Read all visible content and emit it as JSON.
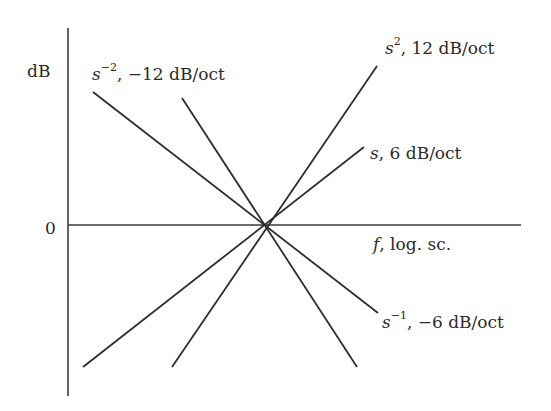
{
  "diagram": {
    "type": "bode-asymptote-slopes",
    "axes": {
      "y_label": "dB",
      "zero_label": "0",
      "x_label_var": "f",
      "x_label_rest": ", log. sc."
    },
    "origin": {
      "x": 265,
      "y": 225
    },
    "lines": [
      {
        "id": "s2",
        "base": "s",
        "exp": "2",
        "slope_text": ", 12 dB/oct",
        "x1": 172,
        "y1": 367,
        "x2": 377,
        "y2": 66
      },
      {
        "id": "s1",
        "base": "s",
        "exp": "",
        "slope_text": ", 6 dB/oct",
        "x1": 83,
        "y1": 367,
        "x2": 364,
        "y2": 147
      },
      {
        "id": "sm1",
        "base": "s",
        "exp": "−1",
        "slope_text": ", −6 dB/oct",
        "x1": 93,
        "y1": 92,
        "x2": 378,
        "y2": 313
      },
      {
        "id": "sm2",
        "base": "s",
        "exp": "−2",
        "slope_text": ", −12 dB/oct",
        "x1": 182,
        "y1": 98,
        "x2": 357,
        "y2": 367
      }
    ],
    "colors": {
      "ink": "#2e2e2e",
      "background": "#ffffff"
    }
  }
}
